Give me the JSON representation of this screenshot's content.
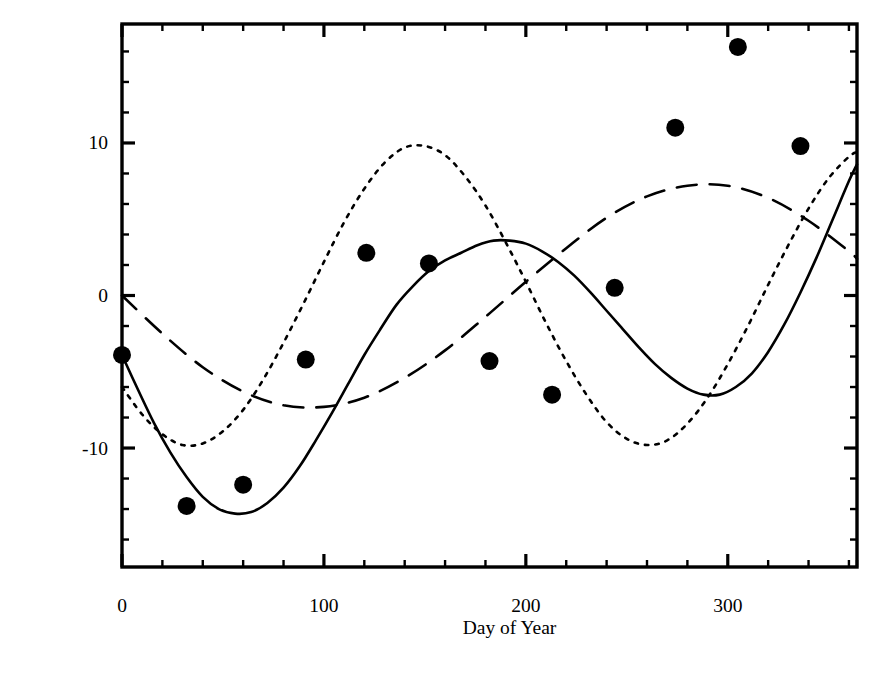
{
  "figure": {
    "xlabel": "Day of Year",
    "ylabel": "Apparent – Mean Solar Time (min)"
  },
  "chart_data": {
    "type": "line",
    "title": "",
    "xlabel": "Day of Year",
    "ylabel": "Apparent – Mean Solar Time (min)",
    "xlim": [
      0,
      364
    ],
    "ylim": [
      -17.8,
      17.8
    ],
    "xticks": [
      0,
      100,
      200,
      300
    ],
    "xtick_labels": [
      "0",
      "100",
      "200",
      "300"
    ],
    "xminor_step": 20,
    "yticks": [
      -10,
      0,
      10
    ],
    "ytick_labels": [
      "-10",
      "0",
      "10"
    ],
    "yminor_step": 2,
    "grid": false,
    "legend": false,
    "legend_position": "none",
    "series": [
      {
        "name": "Equation of Time (total)",
        "style": "solid",
        "linewidth": 2.6,
        "color": "#000000",
        "has_markers": true,
        "marker": "filled-circle",
        "marker_size": 9,
        "x": [
          0,
          8,
          16,
          24,
          32,
          40,
          48,
          56,
          64,
          72,
          80,
          88,
          96,
          104,
          112,
          120,
          128,
          136,
          144,
          152,
          160,
          168,
          176,
          184,
          192,
          200,
          208,
          216,
          224,
          232,
          240,
          248,
          256,
          264,
          272,
          280,
          288,
          296,
          304,
          312,
          320,
          328,
          336,
          344,
          352,
          360,
          364
        ],
        "y": [
          -3.9,
          -6.2,
          -8.4,
          -10.3,
          -11.9,
          -13.2,
          -14.0,
          -14.3,
          -14.2,
          -13.6,
          -12.6,
          -11.2,
          -9.5,
          -7.7,
          -5.8,
          -3.9,
          -2.2,
          -0.6,
          0.6,
          1.6,
          2.3,
          2.8,
          3.3,
          3.6,
          3.6,
          3.4,
          2.9,
          2.2,
          1.3,
          0.2,
          -1.0,
          -2.2,
          -3.4,
          -4.5,
          -5.4,
          -6.1,
          -6.5,
          -6.5,
          -6.0,
          -5.1,
          -3.7,
          -1.9,
          0.2,
          2.5,
          5.0,
          7.5,
          8.6
        ]
      },
      {
        "name": "Eccentricity component",
        "style": "dashed",
        "linewidth": 2.6,
        "color": "#000000",
        "has_markers": false,
        "amplitude": 7.3,
        "period_days": 365,
        "x": [
          0,
          20,
          40,
          60,
          80,
          100,
          120,
          140,
          160,
          180,
          200,
          220,
          240,
          260,
          280,
          300,
          320,
          340,
          360,
          364
        ],
        "y": [
          0.0,
          -2.5,
          -4.7,
          -6.3,
          -7.2,
          -7.3,
          -6.7,
          -5.4,
          -3.6,
          -1.4,
          0.9,
          3.1,
          5.1,
          6.5,
          7.2,
          7.2,
          6.4,
          4.9,
          2.9,
          2.4
        ]
      },
      {
        "name": "Obliquity component",
        "style": "dotted",
        "linewidth": 2.6,
        "color": "#000000",
        "has_markers": false,
        "amplitude": 9.8,
        "period_days": 182.5,
        "x": [
          0,
          10,
          20,
          30,
          40,
          50,
          60,
          70,
          80,
          90,
          100,
          110,
          120,
          130,
          140,
          150,
          160,
          170,
          180,
          190,
          200,
          210,
          220,
          230,
          240,
          250,
          260,
          270,
          280,
          290,
          300,
          310,
          320,
          330,
          340,
          350,
          360,
          364
        ],
        "y": [
          -6.0,
          -7.8,
          -9.1,
          -9.8,
          -9.7,
          -8.9,
          -7.5,
          -5.5,
          -3.1,
          -0.5,
          2.2,
          4.8,
          7.0,
          8.7,
          9.7,
          9.8,
          9.2,
          7.8,
          5.9,
          3.5,
          0.9,
          -1.8,
          -4.3,
          -6.5,
          -8.3,
          -9.4,
          -9.8,
          -9.5,
          -8.4,
          -6.7,
          -4.5,
          -2.0,
          0.7,
          3.3,
          5.7,
          7.7,
          9.1,
          9.4
        ]
      }
    ],
    "data_points": [
      {
        "day": 0,
        "value": -3.9
      },
      {
        "day": 32,
        "value": -13.8
      },
      {
        "day": 60,
        "value": -12.4
      },
      {
        "day": 91,
        "value": -4.2
      },
      {
        "day": 121,
        "value": 2.8
      },
      {
        "day": 152,
        "value": 2.1
      },
      {
        "day": 182,
        "value": -4.3
      },
      {
        "day": 213,
        "value": -6.5
      },
      {
        "day": 244,
        "value": 0.5
      },
      {
        "day": 274,
        "value": 11.0
      },
      {
        "day": 305,
        "value": 16.3
      },
      {
        "day": 336,
        "value": 9.8
      }
    ]
  }
}
